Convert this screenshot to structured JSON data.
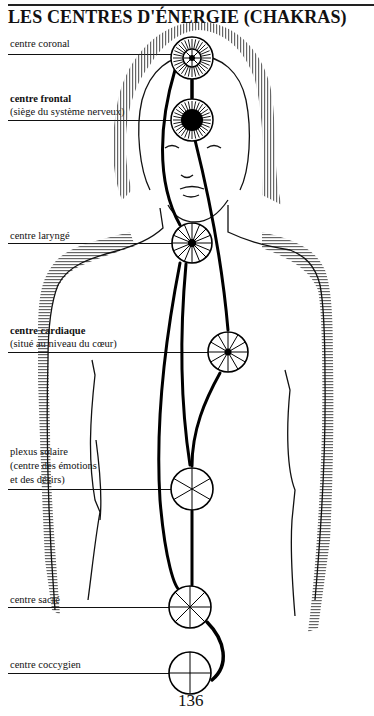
{
  "header": {
    "title": "LES CENTRES D'ÉNERGIE  (CHAKRAS)"
  },
  "chakras": [
    {
      "id": "coronal",
      "name": "centre coronal",
      "subtitle": "",
      "bold": false,
      "cx": 192,
      "cy": 58,
      "type": "dense-ring-inner-rosette"
    },
    {
      "id": "frontal",
      "name": "centre frontal",
      "subtitle": "(siège du système nerveux)",
      "bold": true,
      "cx": 192,
      "cy": 120,
      "type": "dense-ring-filled-core"
    },
    {
      "id": "larynge",
      "name": "centre laryngé",
      "subtitle": "",
      "bold": false,
      "cx": 192,
      "cy": 243,
      "spokes": 16
    },
    {
      "id": "cardiaque",
      "name": "centre cardiaque",
      "subtitle": "(situé au niveau du cœur)",
      "bold": true,
      "cx": 228,
      "cy": 352,
      "spokes": 12
    },
    {
      "id": "solaire",
      "name": "plexus solaire",
      "subtitle": "(centre des émotions",
      "subtitle2": "et des désirs)",
      "bold": false,
      "cx": 192,
      "cy": 489,
      "spokes": 6
    },
    {
      "id": "sacre",
      "name": "centre sacré",
      "subtitle": "",
      "bold": false,
      "cx": 190,
      "cy": 606,
      "spokes": 8
    },
    {
      "id": "coccygien",
      "name": "centre coccygien",
      "subtitle": "",
      "bold": false,
      "cx": 190,
      "cy": 670,
      "spokes": 4
    }
  ],
  "footer": {
    "page_number": "136"
  }
}
